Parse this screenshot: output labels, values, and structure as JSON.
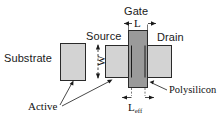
{
  "diagram": {
    "type": "semiconductor-layout",
    "background": "#ffffff",
    "colors": {
      "active_fill": "#d3d3d3",
      "poly_fill": "#9a9a9a",
      "outline": "#1a1a1a",
      "text": "#1a1a1a"
    }
  },
  "labels": {
    "substrate": "Substrate",
    "source": "Source",
    "gate": "Gate",
    "drain": "Drain",
    "active": "Active",
    "polysilicon": "Polysilicon"
  },
  "dimensions": {
    "length": "L",
    "width": "W",
    "effective_length_base": "L",
    "effective_length_sub": "eff"
  },
  "shapes": [
    {
      "name": "substrate-rect",
      "x": 60,
      "y": 43,
      "w": 26,
      "h": 38,
      "fill": "#d3d3d3"
    },
    {
      "name": "source-rect",
      "x": 105,
      "y": 45,
      "w": 28,
      "h": 33,
      "fill": "#d3d3d3"
    },
    {
      "name": "drain-rect",
      "x": 144,
      "y": 45,
      "w": 28,
      "h": 33,
      "fill": "#d3d3d3"
    },
    {
      "name": "gate-poly-rect",
      "x": 128,
      "y": 30,
      "w": 20,
      "h": 58,
      "fill": "#9a9a9a"
    }
  ]
}
